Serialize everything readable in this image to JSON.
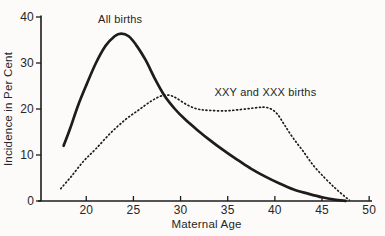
{
  "figure": {
    "background": "#fcfbf9",
    "ink": "#1c1c1c",
    "text_color": "#262626"
  },
  "chart_data": {
    "type": "line",
    "title": "",
    "xlabel": "Maternal Age",
    "ylabel": "Incidence in Per Cent",
    "xlim": [
      15.2,
      50.3
    ],
    "ylim": [
      0,
      40
    ],
    "x_ticks": [
      20,
      25,
      30,
      35,
      40,
      45,
      50
    ],
    "y_ticks": [
      0,
      10,
      20,
      30,
      40
    ],
    "grid": false,
    "legend_position": "inline-annotations",
    "series": [
      {
        "name": "All births",
        "style": "solid",
        "stroke_width": 2.7,
        "points": [
          [
            17.6,
            12.0
          ],
          [
            18.3,
            15.8
          ],
          [
            19.1,
            20.6
          ],
          [
            20.0,
            25.2
          ],
          [
            21.0,
            29.9
          ],
          [
            22.0,
            33.6
          ],
          [
            23.0,
            35.8
          ],
          [
            23.7,
            36.4
          ],
          [
            24.5,
            35.8
          ],
          [
            25.3,
            33.9
          ],
          [
            26.3,
            30.6
          ],
          [
            27.3,
            26.5
          ],
          [
            28.3,
            22.9
          ],
          [
            29.4,
            20.0
          ],
          [
            30.5,
            17.7
          ],
          [
            31.8,
            15.4
          ],
          [
            33.0,
            13.4
          ],
          [
            34.5,
            11.1
          ],
          [
            36.0,
            9.0
          ],
          [
            37.5,
            7.0
          ],
          [
            39.0,
            5.3
          ],
          [
            40.5,
            3.8
          ],
          [
            42.0,
            2.5
          ],
          [
            43.5,
            1.6
          ],
          [
            45.0,
            0.8
          ],
          [
            46.3,
            0.3
          ],
          [
            47.5,
            0.05
          ]
        ]
      },
      {
        "name": "XXY and XXX births",
        "style": "dotted",
        "stroke_width": 1.7,
        "points": [
          [
            17.3,
            2.7
          ],
          [
            18.4,
            5.3
          ],
          [
            19.7,
            8.6
          ],
          [
            21.0,
            11.3
          ],
          [
            22.5,
            14.6
          ],
          [
            24.1,
            17.6
          ],
          [
            25.5,
            19.7
          ],
          [
            26.8,
            21.6
          ],
          [
            27.9,
            22.8
          ],
          [
            28.8,
            23.0
          ],
          [
            29.6,
            22.3
          ],
          [
            30.7,
            20.9
          ],
          [
            31.8,
            20.0
          ],
          [
            33.0,
            19.7
          ],
          [
            34.8,
            19.6
          ],
          [
            36.4,
            19.9
          ],
          [
            37.7,
            20.2
          ],
          [
            38.8,
            20.4
          ],
          [
            39.6,
            20.0
          ],
          [
            40.3,
            18.8
          ],
          [
            41.0,
            16.6
          ],
          [
            41.9,
            13.8
          ],
          [
            43.0,
            10.8
          ],
          [
            44.1,
            7.7
          ],
          [
            45.3,
            5.0
          ],
          [
            46.4,
            2.8
          ],
          [
            47.4,
            1.0
          ],
          [
            47.9,
            0.2
          ]
        ]
      }
    ],
    "annotations": [
      {
        "text": "All births",
        "x": 23.6,
        "y": 38.7,
        "anchor": "middle"
      },
      {
        "text": "XXY and XXX births",
        "x": 39.0,
        "y": 22.9,
        "anchor": "middle"
      }
    ]
  }
}
